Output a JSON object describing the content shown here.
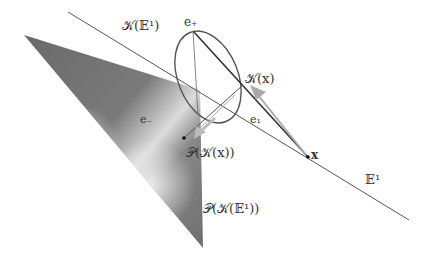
{
  "labels": {
    "kappa_E1": "𝒦(𝔼¹)",
    "e_plus": "e₊",
    "kappa_x": "𝒦(x)",
    "e_1": "e₁",
    "e_minus": "e₋",
    "proj_kappa_x": "𝒫(𝒦(x))",
    "x": "x",
    "E1": "𝔼¹",
    "proj_kappa_E1": "𝒫(𝒦(𝔼¹))"
  },
  "colors": {
    "line": "#555555",
    "dark_line": "#333333",
    "arrow": "#aaaaaa",
    "surface_dark": "#6e6e6e",
    "surface_light": "#e6e6e6"
  }
}
